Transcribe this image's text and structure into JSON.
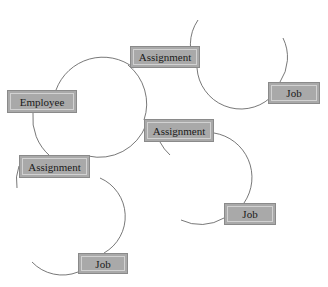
{
  "diagram": {
    "type": "entity-relationship",
    "colors": {
      "node_fill": "#a9a9a9",
      "node_border": "#8a8a8a",
      "node_inner_border": "#d2d2d2",
      "edge": "#555555",
      "background": "#ffffff"
    },
    "nodes": [
      {
        "id": "employee",
        "label": "Employee",
        "x": 7,
        "y": 90,
        "w": 70,
        "h": 23
      },
      {
        "id": "assignment-top",
        "label": "Assignment",
        "x": 130,
        "y": 46,
        "w": 70,
        "h": 22
      },
      {
        "id": "assignment-middle",
        "label": "Assignment",
        "x": 144,
        "y": 119,
        "w": 70,
        "h": 23
      },
      {
        "id": "assignment-left",
        "label": "Assignment",
        "x": 19,
        "y": 155,
        "w": 71,
        "h": 23
      },
      {
        "id": "job-top-right",
        "label": "Job",
        "x": 268,
        "y": 82,
        "w": 52,
        "h": 22
      },
      {
        "id": "job-middle-right",
        "label": "Job",
        "x": 224,
        "y": 203,
        "w": 52,
        "h": 22
      },
      {
        "id": "job-bottom",
        "label": "Job",
        "x": 78,
        "y": 253,
        "w": 50,
        "h": 21
      }
    ],
    "edges": [
      {
        "id": "arc-employee-loop",
        "d": "M 134 68 A 50 50 0 0 0 56 90 M 33 113 A 50 50 0 0 0 50 156 M 88 156 A 50 50 0 0 0 146 125 M 144 120 A 50 50 0 0 0 128 65"
      },
      {
        "id": "arc-top-job",
        "d": "M 198 20 A 44 44 0 0 0 197 68 A 44 44 0 0 0 270 98 M 280 82 A 44 44 0 0 0 283 38"
      },
      {
        "id": "arc-middle-job",
        "d": "M 214 133 A 45 45 0 0 1 244 203 M 224 218 A 45 45 0 0 1 181 220 M 160 142 A 45 45 0 0 0 170 155"
      },
      {
        "id": "arc-left-job",
        "d": "M 100 178 A 42 42 0 0 1 104 253 M 78 272 A 42 42 0 0 1 32 262 M 19 166 A 42 42 0 0 0 17 188"
      }
    ]
  }
}
